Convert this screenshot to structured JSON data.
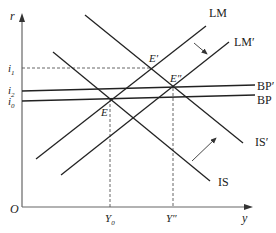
{
  "diagram": {
    "axes": {
      "y_label": "r",
      "x_label": "y",
      "origin_label": "O"
    },
    "y_ticks": [
      {
        "id": "i1",
        "label": "i",
        "sub": "1"
      },
      {
        "id": "i2",
        "label": "i",
        "sub": "2"
      },
      {
        "id": "i0",
        "label": "i",
        "sub": "0"
      }
    ],
    "x_ticks": [
      {
        "id": "y0",
        "label": "Y",
        "sub": "0"
      },
      {
        "id": "ydd",
        "label": "Y″",
        "sub": ""
      }
    ],
    "curves": {
      "LM": "LM",
      "LM_prime": "LM′",
      "IS": "IS",
      "IS_prime": "IS′",
      "BP": "BP",
      "BP_prime": "BP′"
    },
    "points": {
      "E": "E",
      "E_prime": "E′",
      "E_dprime": "E″"
    },
    "colors": {
      "line": "#222222",
      "dashed": "#555555"
    }
  }
}
